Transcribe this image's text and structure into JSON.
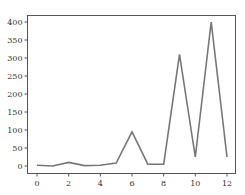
{
  "chart_data": {
    "type": "line",
    "title": "",
    "xlabel": "",
    "ylabel": "",
    "x": [
      0,
      1,
      2,
      3,
      4,
      5,
      6,
      7,
      8,
      9,
      10,
      11,
      12
    ],
    "series": [
      {
        "name": "series",
        "values": [
          2,
          0,
          10,
          1,
          2,
          8,
          95,
          5,
          5,
          310,
          25,
          400,
          25
        ],
        "color": "#777777"
      }
    ],
    "xlim": [
      -0.6,
      12.5
    ],
    "ylim": [
      -20,
      420
    ],
    "xticks": [
      0,
      2,
      4,
      6,
      8,
      10,
      12
    ],
    "yticks": [
      0,
      50,
      100,
      150,
      200,
      250,
      300,
      350,
      400
    ],
    "grid": false,
    "legend": null
  }
}
